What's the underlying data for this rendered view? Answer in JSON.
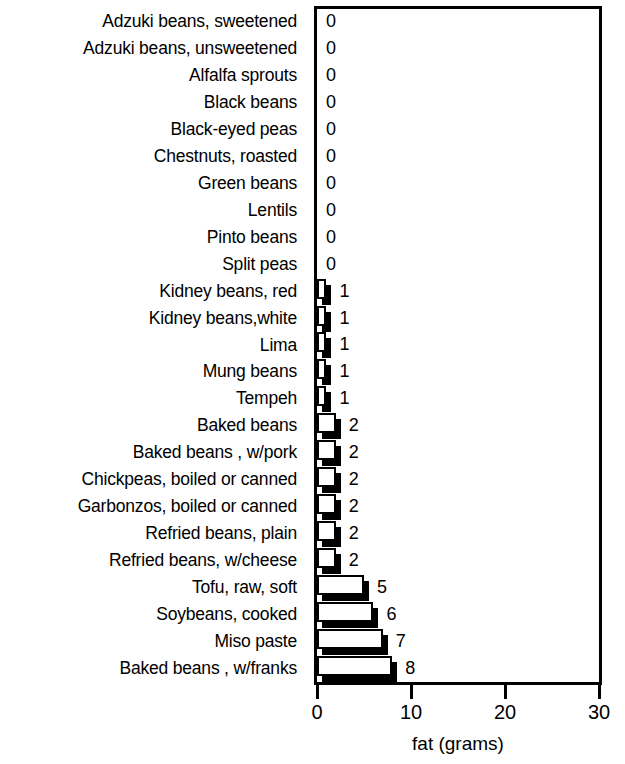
{
  "chart_data": {
    "type": "bar",
    "orientation": "horizontal",
    "title": "",
    "xlabel": "fat (grams)",
    "ylabel": "",
    "xlim": [
      0,
      30
    ],
    "xticks": [
      "0",
      "10",
      "20",
      "30"
    ],
    "xtick_values": [
      0,
      10,
      20,
      30
    ],
    "grid": false,
    "legend": null,
    "show_value_labels": true,
    "categories": [
      "Adzuki beans, sweetened",
      "Adzuki beans, unsweetened",
      "Alfalfa sprouts",
      "Black beans",
      "Black-eyed peas",
      "Chestnuts, roasted",
      "Green beans",
      "Lentils",
      "Pinto beans",
      "Split peas",
      "Kidney beans, red",
      "Kidney beans,white",
      "Lima",
      "Mung beans",
      "Tempeh",
      "Baked beans",
      "Baked beans , w/pork",
      "Chickpeas, boiled or canned",
      "Garbonzos, boiled or canned",
      "Refried beans, plain",
      "Refried beans, w/cheese",
      "Tofu, raw, soft",
      "Soybeans, cooked",
      "Miso paste",
      "Baked beans , w/franks"
    ],
    "values": [
      0,
      0,
      0,
      0,
      0,
      0,
      0,
      0,
      0,
      0,
      1,
      1,
      1,
      1,
      1,
      2,
      2,
      2,
      2,
      2,
      2,
      5,
      6,
      7,
      8
    ],
    "value_labels": [
      "0",
      "0",
      "0",
      "0",
      "0",
      "0",
      "0",
      "0",
      "0",
      "0",
      "1",
      "1",
      "1",
      "1",
      "1",
      "2",
      "2",
      "2",
      "2",
      "2",
      "2",
      "5",
      "6",
      "7",
      "8"
    ],
    "colors": {
      "bar_face": "#ffffff",
      "bar_outline": "#000000",
      "bar_shadow": "#000000",
      "axis": "#000000",
      "text": "#000000",
      "background": "#ffffff"
    }
  }
}
